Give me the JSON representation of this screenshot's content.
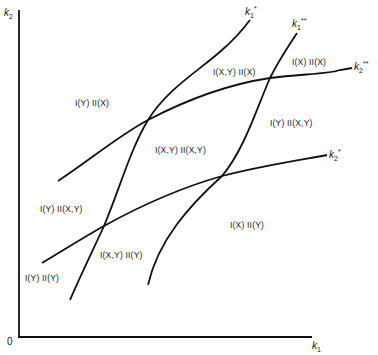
{
  "diagram": {
    "axes": {
      "y_label": "k2",
      "x_label": "k1",
      "origin_label": "0"
    },
    "curves": [
      {
        "id": "k1_star",
        "label": "k1*",
        "base": "k1",
        "sup": "*"
      },
      {
        "id": "k1_star_star",
        "label": "k1**",
        "base": "k1",
        "sup": "**"
      },
      {
        "id": "k2_star_star",
        "label": "k2**",
        "base": "k2",
        "sup": "**"
      },
      {
        "id": "k2_star",
        "label": "k2*",
        "base": "k2",
        "sup": "*"
      }
    ],
    "regions": [
      {
        "label": "I(Y) II(X)"
      },
      {
        "label": "I(X,Y) II(X)"
      },
      {
        "label": "I(X) II(X)"
      },
      {
        "label": "I(X,Y) II(X,Y)"
      },
      {
        "label": "I(Y) II(X,Y)"
      },
      {
        "label": "I(Y) II(X,Y)"
      },
      {
        "label": "I(X,Y) II(Y)"
      },
      {
        "label": "I(X) II(Y)"
      },
      {
        "label": "I(Y) II(Y)"
      }
    ],
    "stroke_color": "#111111"
  }
}
